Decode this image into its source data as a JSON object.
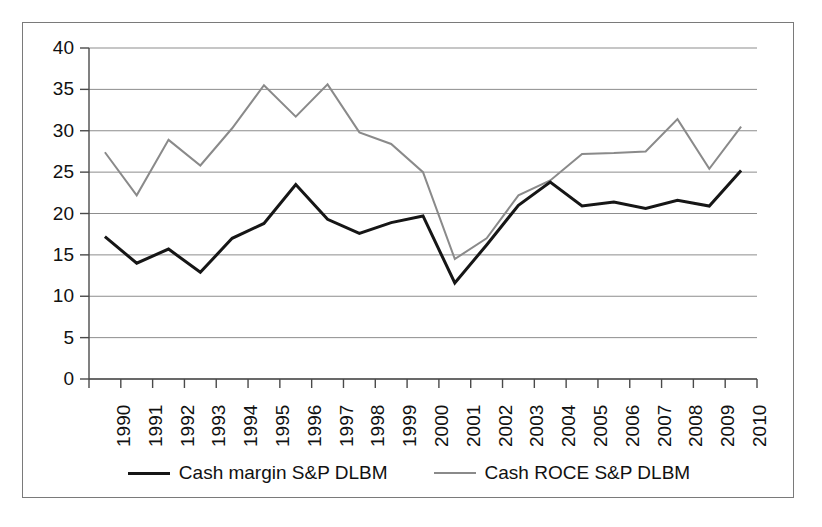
{
  "chart_data": {
    "type": "line",
    "title": "",
    "xlabel": "",
    "ylabel": "",
    "grid": true,
    "legend_position": "bottom",
    "ylim": [
      0,
      40
    ],
    "yticks": [
      0,
      5,
      10,
      15,
      20,
      25,
      30,
      35,
      40
    ],
    "categories": [
      "1990",
      "1991",
      "1992",
      "1993",
      "1994",
      "1995",
      "1996",
      "1997",
      "1998",
      "1999",
      "2000",
      "2001",
      "2002",
      "2003",
      "2004",
      "2005",
      "2006",
      "2007",
      "2008",
      "2009",
      "2010"
    ],
    "series": [
      {
        "name": "Cash margin S&P DLBM",
        "color": "#161616",
        "width": 3,
        "values": [
          17.2,
          14.0,
          15.7,
          12.9,
          17.0,
          18.8,
          23.5,
          19.3,
          17.6,
          18.9,
          19.7,
          11.6,
          16.2,
          21.0,
          23.8,
          20.9,
          21.4,
          20.6,
          21.6,
          20.9,
          25.2
        ]
      },
      {
        "name": "Cash ROCE S&P DLBM",
        "color": "#8a8a8a",
        "width": 2,
        "values": [
          27.4,
          22.2,
          28.9,
          25.8,
          30.3,
          35.5,
          31.7,
          35.6,
          29.8,
          28.4,
          25.0,
          14.5,
          17.0,
          22.2,
          24.0,
          27.2,
          27.3,
          27.5,
          31.4,
          25.4,
          30.5
        ]
      }
    ]
  },
  "legend": {
    "entries": [
      {
        "label": "Cash margin S&P DLBM"
      },
      {
        "label": "Cash ROCE S&P DLBM"
      }
    ]
  }
}
